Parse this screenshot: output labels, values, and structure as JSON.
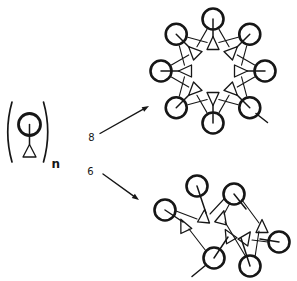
{
  "colors": {
    "background": "#ffffff",
    "ink": "#161616"
  },
  "monomer": {
    "subscript": "n",
    "subscript_pos": [
      51.5,
      168
    ],
    "circle": {
      "cx": 29.5,
      "cy": 124.5,
      "r": 11
    },
    "bond": {
      "from": [
        29.5,
        124.5
      ],
      "to": [
        29.5,
        144.5
      ]
    },
    "triangle": {
      "apex": [
        29.5,
        144.5
      ],
      "base_left": [
        23,
        157
      ],
      "base_right": [
        36,
        157
      ]
    },
    "paren_left_path": "M 12 102 Q 3.5 132 12 162",
    "paren_right_path": "M 43.5 102 Q 52 132 43.5 162"
  },
  "branches": [
    {
      "count": "8",
      "count_pos": [
        91.5,
        141
      ],
      "arrow_from": [
        100,
        133.5
      ],
      "arrow_to": [
        149,
        106
      ]
    },
    {
      "count": "6",
      "count_pos": [
        90.5,
        174.5
      ],
      "arrow_from": [
        103,
        174
      ],
      "arrow_to": [
        139,
        200
      ]
    }
  ],
  "octamer": {
    "units": 8,
    "center": [
      213,
      71
    ],
    "ring_radius": 52,
    "triangle_radius": 27,
    "circle_radius": 10.5,
    "stick_inner_radius": 34,
    "start_angle": 90,
    "tail": {
      "from": [
        256,
        113.5
      ],
      "to": [
        267.5,
        122.5
      ]
    }
  },
  "hexamer": {
    "units": 6,
    "circle_radius": 10.5,
    "circles": [
      [
        197,
        186
      ],
      [
        234,
        194
      ],
      [
        279,
        242
      ],
      [
        250,
        266
      ],
      [
        214,
        258
      ],
      [
        165,
        210
      ]
    ],
    "sticks": [
      [
        [
          197,
          186
        ],
        [
          206,
          213
        ]
      ],
      [
        [
          234,
          194
        ],
        [
          246,
          209
        ]
      ],
      [
        [
          279,
          242
        ],
        [
          260,
          239
        ]
      ],
      [
        [
          250,
          266
        ],
        [
          241,
          238
        ]
      ],
      [
        [
          214,
          258
        ],
        [
          228,
          237
        ]
      ],
      [
        [
          165,
          210
        ],
        [
          183,
          222
        ]
      ]
    ],
    "triangles": [
      {
        "c": [
          204,
          217
        ],
        "rot": 5
      },
      {
        "c": [
          222,
          218
        ],
        "rot": 15
      },
      {
        "c": [
          262,
          227
        ],
        "rot": 0
      },
      {
        "c": [
          246,
          238
        ],
        "rot": 35
      },
      {
        "c": [
          229,
          236
        ],
        "rot": -30
      },
      {
        "c": [
          184,
          226
        ],
        "rot": -25
      }
    ],
    "connectors": [
      [
        [
          210,
          214
        ],
        [
          224,
          199
        ]
      ],
      [
        [
          197,
          219
        ],
        [
          176,
          211
        ]
      ],
      [
        [
          225,
          222
        ],
        [
          246,
          257
        ]
      ],
      [
        [
          259,
          223
        ],
        [
          242,
          200
        ]
      ],
      [
        [
          224,
          214
        ],
        [
          230,
          203
        ]
      ],
      [
        [
          189,
          229
        ],
        [
          206,
          251
        ]
      ],
      [
        [
          252,
          240
        ],
        [
          268,
          242
        ]
      ],
      [
        [
          259,
          231
        ],
        [
          255,
          257
        ]
      ]
    ],
    "tail": {
      "from": [
        206,
        265
      ],
      "to": [
        192,
        276.5
      ]
    }
  }
}
